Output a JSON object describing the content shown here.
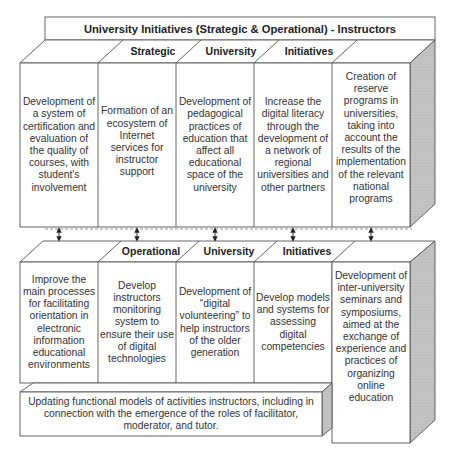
{
  "title": "University Initiatives (Strategic & Operational) - Instructors",
  "strategic": {
    "headers": [
      "Strategic",
      "University",
      "Initiatives"
    ],
    "items": [
      "Development of a system of certification and evaluation of the quality of courses, with student's involvement",
      "Formation of an ecosystem of Internet services for instructor support",
      "Development of pedagogical practices of education that affect all educational space of the university",
      "Increase the digital literacy through the development of a network of regional universities and other partners",
      "Creation of reserve programs in universities, taking into account the results of the implementation of the relevant national programs"
    ]
  },
  "operational": {
    "headers": [
      "Operational",
      "University",
      "Initiatives"
    ],
    "items": [
      "Improve the main processes for facilitating orientation in electronic information educational environments",
      "Develop instructors monitoring system to ensure their use of digital technologies",
      "Development of “digital volunteering” to help instructors of the older generation",
      "Develop models and systems for assessing digital competencies",
      "Development of inter-university seminars and symposiums, aimed at the exchange of experience and practices of organizing online education"
    ],
    "footer": "Updating functional models of activities instructors, including in connection with the emergence of the roles of facilitator, moderator, and tutor."
  },
  "connectors": {
    "count": 5,
    "style": "double-arrow",
    "divider": "dashed"
  },
  "colors": {
    "line": "#555555",
    "side_shade": "#bdbdbd",
    "fill": "#ffffff",
    "text": "#333333"
  }
}
